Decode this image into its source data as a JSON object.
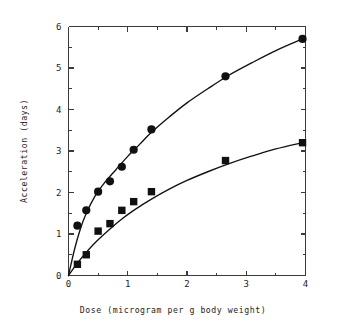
{
  "chart_data": {
    "type": "scatter",
    "title": "",
    "subtitle": "",
    "xlabel": "Dose (microgram per g body weight)",
    "ylabel": "Acceleration (days)",
    "xlim": [
      0,
      4
    ],
    "ylim": [
      0,
      6
    ],
    "xticks": [
      0,
      1,
      2,
      3,
      4
    ],
    "xtick_labels": [
      "0",
      "1",
      "2",
      "3",
      "4"
    ],
    "xticks_minor": [
      0.5,
      1.5,
      2.5,
      3.5
    ],
    "yticks": [
      0,
      1,
      2,
      3,
      4,
      5,
      6
    ],
    "ytick_labels": [
      "0",
      "1",
      "2",
      "3",
      "4",
      "5",
      "6"
    ],
    "yticks_minor": [
      0.5,
      1.5,
      2.5,
      3.5,
      4.5,
      5.5
    ],
    "grid": false,
    "legend": false,
    "legend_position": "none",
    "frame": "box",
    "marker_color": "#111111",
    "line_color": "#111111",
    "series": [
      {
        "name": "Upper dose-response series",
        "marker": "circle",
        "x": [
          0.15,
          0.3,
          0.5,
          0.7,
          0.9,
          1.1,
          1.4,
          2.65,
          3.95
        ],
        "y": [
          1.2,
          1.57,
          2.02,
          2.27,
          2.62,
          3.03,
          3.52,
          4.8,
          5.7
        ],
        "fit_points": [
          [
            0.0,
            0.0
          ],
          [
            0.1,
            0.62
          ],
          [
            0.2,
            1.12
          ],
          [
            0.3,
            1.5
          ],
          [
            0.45,
            1.92
          ],
          [
            0.6,
            2.22
          ],
          [
            0.8,
            2.55
          ],
          [
            1.0,
            2.87
          ],
          [
            1.2,
            3.16
          ],
          [
            1.4,
            3.45
          ],
          [
            1.7,
            3.82
          ],
          [
            2.0,
            4.16
          ],
          [
            2.35,
            4.5
          ],
          [
            2.7,
            4.82
          ],
          [
            3.1,
            5.13
          ],
          [
            3.5,
            5.42
          ],
          [
            3.95,
            5.7
          ]
        ]
      },
      {
        "name": "Lower dose-response series",
        "marker": "square",
        "x": [
          0.15,
          0.3,
          0.5,
          0.7,
          0.9,
          1.1,
          1.4,
          2.65,
          3.95
        ],
        "y": [
          0.27,
          0.5,
          1.07,
          1.25,
          1.57,
          1.78,
          2.02,
          2.77,
          3.2
        ],
        "fit_points": [
          [
            0.0,
            0.0
          ],
          [
            0.1,
            0.2
          ],
          [
            0.2,
            0.39
          ],
          [
            0.35,
            0.64
          ],
          [
            0.5,
            0.86
          ],
          [
            0.7,
            1.12
          ],
          [
            0.9,
            1.36
          ],
          [
            1.1,
            1.57
          ],
          [
            1.4,
            1.84
          ],
          [
            1.7,
            2.08
          ],
          [
            2.0,
            2.29
          ],
          [
            2.35,
            2.5
          ],
          [
            2.7,
            2.69
          ],
          [
            3.1,
            2.88
          ],
          [
            3.5,
            3.05
          ],
          [
            3.95,
            3.2
          ]
        ]
      }
    ]
  },
  "figure": {
    "background_color": "#ffffff",
    "axis_color": "#3a3a3a",
    "text_color": "#242424"
  }
}
